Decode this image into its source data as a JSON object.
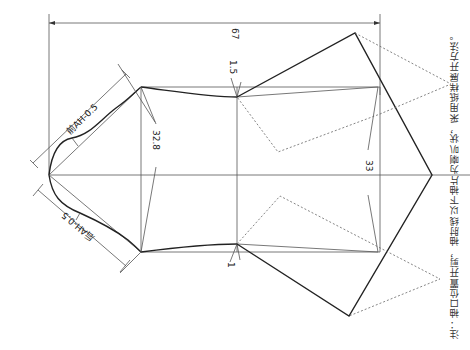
{
  "diagram": {
    "labels": {
      "overall_width": "67",
      "front_ah": "前AH-0.5",
      "back_ah": "后AH-0.5",
      "left_length": "32.8",
      "right_length": "33",
      "top_offset": "1.5",
      "bottom_offset": "1"
    },
    "note": "注：袖口位置开剪，袖肘线以下袖片为喇叭状，采用纸样展开方法。",
    "colors": {
      "line": "#222222",
      "thin_line": "#555555",
      "dashed_line": "#666666",
      "background": "#ffffff"
    }
  }
}
